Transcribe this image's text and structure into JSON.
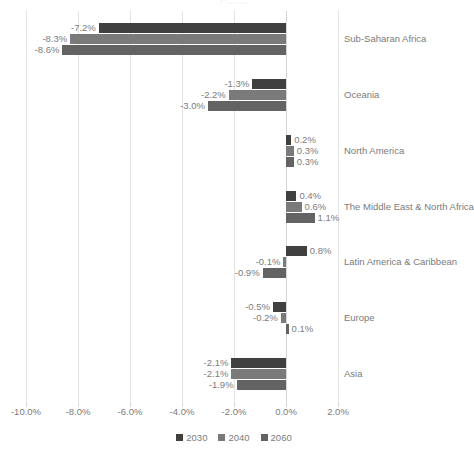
{
  "chart_data": {
    "type": "bar",
    "orientation": "horizontal",
    "title": "",
    "xlabel": "",
    "ylabel": "",
    "xlim": [
      -10.0,
      2.0
    ],
    "xticks": [
      "-10.0%",
      "-8.0%",
      "-6.0%",
      "-4.0%",
      "-2.0%",
      "0.0%",
      "2.0%"
    ],
    "xtick_values": [
      -10.0,
      -8.0,
      -6.0,
      -4.0,
      -2.0,
      0.0,
      2.0
    ],
    "grid": true,
    "legend_position": "bottom",
    "value_suffix": "%",
    "categories": [
      "Sub-Saharan Africa",
      "Oceania",
      "North America",
      "The Middle East & North Africa",
      "Latin America & Caribbean",
      "Europe",
      "Asia"
    ],
    "series": [
      {
        "name": "2030",
        "color": "#404040",
        "values": [
          -7.2,
          -1.3,
          0.2,
          0.4,
          0.8,
          -0.5,
          -2.1
        ],
        "labels": [
          "-7.2%",
          "-1.3%",
          "0.2%",
          "0.4%",
          "0.8%",
          "-0.5%",
          "-2.1%"
        ]
      },
      {
        "name": "2040",
        "color": "#7a7a7a",
        "values": [
          -8.3,
          -2.2,
          0.3,
          0.6,
          -0.1,
          -0.2,
          -2.1
        ],
        "labels": [
          "-8.3%",
          "-2.2%",
          "0.3%",
          "0.6%",
          "-0.1%",
          "-0.2%",
          "-2.1%"
        ]
      },
      {
        "name": "2060",
        "color": "#636363",
        "values": [
          -8.6,
          -3.0,
          0.3,
          1.1,
          -0.9,
          0.1,
          -1.9
        ],
        "labels": [
          "-8.6%",
          "-3.0%",
          "0.3%",
          "1.1%",
          "-0.9%",
          "0.1%",
          "-1.9%"
        ]
      }
    ]
  },
  "legend": {
    "items": [
      {
        "label": "2030",
        "color": "#404040"
      },
      {
        "label": "2040",
        "color": "#7a7a7a"
      },
      {
        "label": "2060",
        "color": "#636363"
      }
    ]
  },
  "title_remnant": "Figure"
}
